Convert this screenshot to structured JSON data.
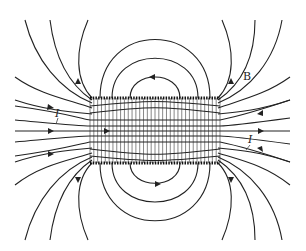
{
  "figure": {
    "labels": {
      "field": "B",
      "current_left": "I",
      "current_right": "I"
    },
    "solenoid": {
      "x0": 90,
      "x1": 220,
      "top": 98,
      "bottom": 163,
      "axis_y": 131,
      "turns": 34
    },
    "colors": {
      "line": "#222222",
      "background": "#ffffff"
    }
  }
}
